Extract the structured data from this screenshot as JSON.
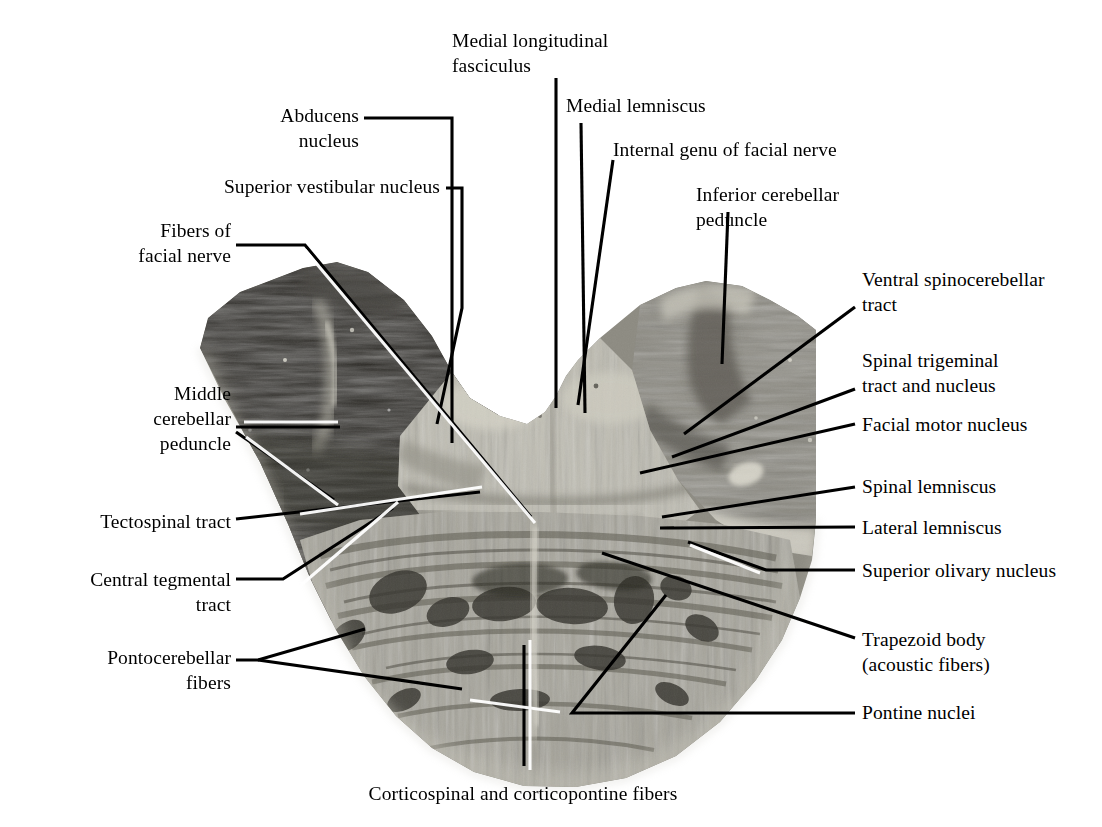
{
  "figure": {
    "kind": "anatomical-photomicrograph",
    "background_color": "#ffffff",
    "ink_color": "#000000"
  },
  "labels": [
    {
      "id": "medial-longitudinal-fasciculus",
      "text": "Medial longitudinal\nfasciculus",
      "align": "left",
      "x": 452,
      "y": 28,
      "w": 200
    },
    {
      "id": "medial-lemniscus",
      "text": "Medial lemniscus",
      "align": "left",
      "x": 566,
      "y": 93,
      "w": 200
    },
    {
      "id": "abducens-nucleus",
      "text": "Abducens\nnucleus",
      "align": "right",
      "x": 249,
      "y": 103,
      "w": 110
    },
    {
      "id": "internal-genu-of-facial-nerve",
      "text": "Internal genu of facial nerve",
      "align": "left",
      "x": 613,
      "y": 137,
      "w": 280
    },
    {
      "id": "superior-vestibular-nucleus",
      "text": "Superior vestibular nucleus",
      "align": "right",
      "x": 165,
      "y": 174,
      "w": 275
    },
    {
      "id": "inferior-cerebellar-peduncle",
      "text": "Inferior cerebellar\npeduncle",
      "align": "left",
      "x": 696,
      "y": 182,
      "w": 200
    },
    {
      "id": "fibers-of-facial-nerve",
      "text": "Fibers of\nfacial nerve",
      "align": "right",
      "x": 104,
      "y": 218,
      "w": 127
    },
    {
      "id": "ventral-spinocerebellar-tract",
      "text": "Ventral spinocerebellar\ntract",
      "align": "left",
      "x": 862,
      "y": 267,
      "w": 240
    },
    {
      "id": "spinal-trigeminal-tract-and-nucleus",
      "text": "Spinal trigeminal\ntract and nucleus",
      "align": "left",
      "x": 862,
      "y": 348,
      "w": 240
    },
    {
      "id": "middle-cerebellar-peduncle",
      "text": "Middle\ncerebellar\npeduncle",
      "align": "right",
      "x": 110,
      "y": 381,
      "w": 121
    },
    {
      "id": "facial-motor-nucleus",
      "text": "Facial motor nucleus",
      "align": "left",
      "x": 862,
      "y": 412,
      "w": 240
    },
    {
      "id": "spinal-lemniscus",
      "text": "Spinal lemniscus",
      "align": "left",
      "x": 862,
      "y": 474,
      "w": 240
    },
    {
      "id": "tectospinal-tract",
      "text": "Tectospinal tract",
      "align": "right",
      "x": 35,
      "y": 509,
      "w": 196
    },
    {
      "id": "lateral-lemniscus",
      "text": "Lateral lemniscus",
      "align": "left",
      "x": 862,
      "y": 515,
      "w": 240
    },
    {
      "id": "superior-olivary-nucleus",
      "text": "Superior olivary nucleus",
      "align": "left",
      "x": 862,
      "y": 558,
      "w": 240
    },
    {
      "id": "central-tegmental-tract",
      "text": "Central tegmental\ntract",
      "align": "right",
      "x": 33,
      "y": 567,
      "w": 198
    },
    {
      "id": "trapezoid-body",
      "text": "Trapezoid body\n(acoustic fibers)",
      "align": "left",
      "x": 862,
      "y": 627,
      "w": 240
    },
    {
      "id": "pontocerebellar-fibers",
      "text": "Pontocerebellar\nfibers",
      "align": "right",
      "x": 40,
      "y": 645,
      "w": 191
    },
    {
      "id": "pontine-nuclei",
      "text": "Pontine nuclei",
      "align": "left",
      "x": 862,
      "y": 700,
      "w": 240
    },
    {
      "id": "corticospinal-and-corticopontine-fibers",
      "text": "Corticospinal and corticopontine fibers",
      "align": "center",
      "x": 313,
      "y": 781,
      "w": 420
    }
  ],
  "leader_lines": [
    {
      "id": "leader-medial-longitudinal-fasciculus",
      "points": "556,78 556,408"
    },
    {
      "id": "leader-medial-lemniscus",
      "points": "581,123 585,413"
    },
    {
      "id": "leader-abducens-nucleus",
      "points": "364,118 452,118 452,443"
    },
    {
      "id": "leader-internal-genu-of-facial-nerve",
      "points": "613,160 578,405"
    },
    {
      "id": "leader-superior-vestibular-nucleus",
      "points": "446,188 462,188 462,308 437,424"
    },
    {
      "id": "leader-inferior-cerebellar-peduncle",
      "points": "728,212 722,364"
    },
    {
      "id": "leader-fibers-of-facial-nerve",
      "points": "236,245 305,245 531,517"
    },
    {
      "id": "leader-ventral-spinocerebellar-tract",
      "points": "855,307 684,434"
    },
    {
      "id": "leader-spinal-trigeminal-tract-and-nucleus",
      "points": "855,389 672,457"
    },
    {
      "id": "leader-middle-cerebellar-peduncle-a",
      "points": "236,427 340,427"
    },
    {
      "id": "leader-middle-cerebellar-peduncle-b",
      "points": "236,432 334,500"
    },
    {
      "id": "leader-facial-motor-nucleus",
      "points": "855,424 640,473"
    },
    {
      "id": "leader-spinal-lemniscus",
      "points": "855,487 662,517"
    },
    {
      "id": "leader-tectospinal-tract",
      "points": "236,519 480,492"
    },
    {
      "id": "leader-lateral-lemniscus",
      "points": "855,527 660,528"
    },
    {
      "id": "leader-superior-olivary-nucleus",
      "points": "855,570 766,570 688,542"
    },
    {
      "id": "leader-central-tegmental-tract",
      "points": "236,579 283,579 393,508"
    },
    {
      "id": "leader-trapezoid-body",
      "points": "855,638 602,553"
    },
    {
      "id": "leader-pontocerebellar-fibers-a",
      "points": "236,660 258,660 365,629"
    },
    {
      "id": "leader-pontocerebellar-fibers-b",
      "points": "258,660 462,689"
    },
    {
      "id": "leader-pontine-nuclei",
      "points": "855,713 572,713 666,595"
    },
    {
      "id": "leader-corticospinal-and-corticopontine-fibers",
      "points": "524,766 524,645"
    }
  ],
  "specimen": {
    "tone_darkest": "#272724",
    "tone_dark": "#4a4843",
    "tone_mid": "#77756d",
    "tone_light": "#a9a79c",
    "tone_lightest": "#cdcbc0",
    "tone_pale": "#e2e0d6"
  }
}
